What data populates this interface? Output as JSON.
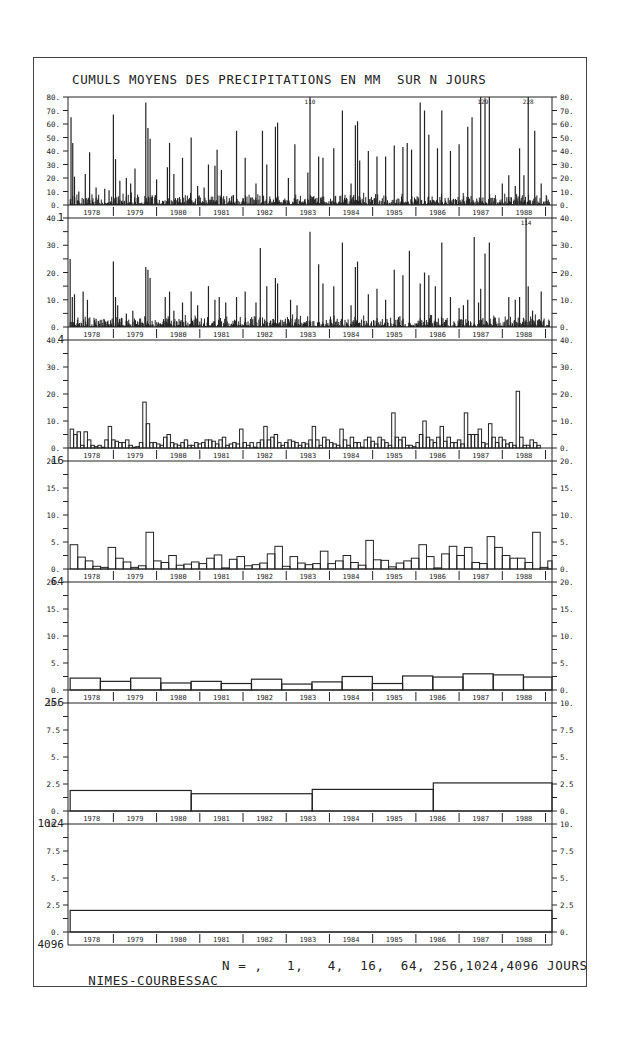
{
  "title": "CUMULS MOYENS DES PRECIPITATIONS EN MM  SUR N JOURS",
  "footer": {
    "station": "NIMES-COURBESSAC",
    "n_label": "N = ,   1,   4,  16,  64, 256,1024,4096 JOURS"
  },
  "chart_data": [
    {
      "type": "bar",
      "title": "N = 1 jour",
      "n_label": "1",
      "ylabel": "mm",
      "ylim": [
        0,
        80
      ],
      "yticks": [
        "0.",
        "10.",
        "20.",
        "30.",
        "40.",
        "50.",
        "60.",
        "70.",
        "80."
      ],
      "annotations": [
        {
          "text": "110",
          "x_year": 1983.55
        },
        {
          "text": "129",
          "x_year": 1987.55
        },
        {
          "text": "228",
          "x_year": 1988.6
        }
      ],
      "years": [
        "1978",
        "1979",
        "1980",
        "1981",
        "1982",
        "1983",
        "1984",
        "1985",
        "1986",
        "1987",
        "1988"
      ],
      "peaks": [
        [
          1978.02,
          65
        ],
        [
          1978.06,
          46
        ],
        [
          1978.1,
          21
        ],
        [
          1978.2,
          10
        ],
        [
          1978.35,
          23
        ],
        [
          1978.45,
          39
        ],
        [
          1978.6,
          13
        ],
        [
          1978.8,
          12
        ],
        [
          1978.9,
          11
        ],
        [
          1979.0,
          67
        ],
        [
          1979.05,
          34
        ],
        [
          1979.15,
          18
        ],
        [
          1979.3,
          20
        ],
        [
          1979.4,
          16
        ],
        [
          1979.5,
          27
        ],
        [
          1979.75,
          76
        ],
        [
          1979.8,
          57
        ],
        [
          1979.85,
          49
        ],
        [
          1980.0,
          19
        ],
        [
          1980.25,
          28
        ],
        [
          1980.3,
          46
        ],
        [
          1980.4,
          23
        ],
        [
          1980.6,
          35
        ],
        [
          1980.8,
          50
        ],
        [
          1980.95,
          14
        ],
        [
          1981.1,
          13
        ],
        [
          1981.2,
          30
        ],
        [
          1981.35,
          29
        ],
        [
          1981.4,
          41
        ],
        [
          1981.5,
          26
        ],
        [
          1981.85,
          55
        ],
        [
          1982.05,
          35
        ],
        [
          1982.3,
          16
        ],
        [
          1982.45,
          55
        ],
        [
          1982.55,
          30
        ],
        [
          1982.75,
          58
        ],
        [
          1982.8,
          61
        ],
        [
          1983.05,
          20
        ],
        [
          1983.2,
          45
        ],
        [
          1983.5,
          24
        ],
        [
          1983.55,
          80
        ],
        [
          1983.75,
          36
        ],
        [
          1983.85,
          35
        ],
        [
          1984.1,
          42
        ],
        [
          1984.3,
          70
        ],
        [
          1984.5,
          16
        ],
        [
          1984.6,
          59
        ],
        [
          1984.65,
          62
        ],
        [
          1984.7,
          33
        ],
        [
          1984.9,
          40
        ],
        [
          1985.1,
          36
        ],
        [
          1985.3,
          36
        ],
        [
          1985.5,
          44
        ],
        [
          1985.7,
          43
        ],
        [
          1985.8,
          46
        ],
        [
          1985.9,
          41
        ],
        [
          1986.1,
          76
        ],
        [
          1986.2,
          70
        ],
        [
          1986.3,
          52
        ],
        [
          1986.5,
          42
        ],
        [
          1986.6,
          70
        ],
        [
          1986.8,
          40
        ],
        [
          1987.0,
          45
        ],
        [
          1987.2,
          58
        ],
        [
          1987.3,
          65
        ],
        [
          1987.5,
          80
        ],
        [
          1987.6,
          79
        ],
        [
          1987.7,
          80
        ],
        [
          1988.0,
          16
        ],
        [
          1988.15,
          22
        ],
        [
          1988.3,
          14
        ],
        [
          1988.4,
          42
        ],
        [
          1988.5,
          22
        ],
        [
          1988.6,
          80
        ],
        [
          1988.75,
          55
        ],
        [
          1988.9,
          16
        ]
      ]
    },
    {
      "type": "bar",
      "title": "N = 4 jours",
      "n_label": "4",
      "ylim": [
        0,
        40
      ],
      "yticks": [
        "0.",
        "10.",
        "20.",
        "30.",
        "40."
      ],
      "annotations": [
        {
          "text": "114",
          "x_year": 1988.55
        }
      ],
      "peaks": [
        [
          1978.0,
          25
        ],
        [
          1978.05,
          11
        ],
        [
          1978.1,
          12
        ],
        [
          1978.3,
          13
        ],
        [
          1978.4,
          10
        ],
        [
          1978.6,
          3
        ],
        [
          1979.0,
          24
        ],
        [
          1979.05,
          11
        ],
        [
          1979.1,
          8
        ],
        [
          1979.3,
          5
        ],
        [
          1979.45,
          6
        ],
        [
          1979.75,
          22
        ],
        [
          1979.8,
          21
        ],
        [
          1979.85,
          18
        ],
        [
          1980.2,
          11
        ],
        [
          1980.3,
          13
        ],
        [
          1980.4,
          6
        ],
        [
          1980.6,
          9
        ],
        [
          1980.8,
          13
        ],
        [
          1980.95,
          8
        ],
        [
          1981.2,
          15
        ],
        [
          1981.35,
          10
        ],
        [
          1981.45,
          11
        ],
        [
          1981.6,
          9
        ],
        [
          1981.85,
          11
        ],
        [
          1982.05,
          13
        ],
        [
          1982.3,
          9
        ],
        [
          1982.4,
          29
        ],
        [
          1982.55,
          15
        ],
        [
          1982.75,
          18
        ],
        [
          1982.8,
          16
        ],
        [
          1983.1,
          10
        ],
        [
          1983.25,
          8
        ],
        [
          1983.55,
          35
        ],
        [
          1983.75,
          23
        ],
        [
          1983.85,
          16
        ],
        [
          1984.1,
          15
        ],
        [
          1984.3,
          31
        ],
        [
          1984.5,
          8
        ],
        [
          1984.6,
          22
        ],
        [
          1984.65,
          24
        ],
        [
          1984.9,
          12
        ],
        [
          1985.1,
          14
        ],
        [
          1985.3,
          10
        ],
        [
          1985.5,
          21
        ],
        [
          1985.7,
          19
        ],
        [
          1985.85,
          28
        ],
        [
          1986.1,
          16
        ],
        [
          1986.2,
          20
        ],
        [
          1986.3,
          19
        ],
        [
          1986.45,
          15
        ],
        [
          1986.6,
          31
        ],
        [
          1986.8,
          11
        ],
        [
          1987.0,
          7
        ],
        [
          1987.1,
          8
        ],
        [
          1987.2,
          10
        ],
        [
          1987.35,
          33
        ],
        [
          1987.45,
          9
        ],
        [
          1987.5,
          14
        ],
        [
          1987.6,
          27
        ],
        [
          1987.7,
          31
        ],
        [
          1988.15,
          11
        ],
        [
          1988.3,
          10
        ],
        [
          1988.4,
          11
        ],
        [
          1988.55,
          40
        ],
        [
          1988.6,
          15
        ],
        [
          1988.7,
          6
        ],
        [
          1988.9,
          13
        ]
      ]
    },
    {
      "type": "bar",
      "title": "N = 16 jours",
      "n_label": "16",
      "ylim": [
        0,
        40
      ],
      "yticks": [
        "0.",
        "10.",
        "20.",
        "30.",
        "40."
      ],
      "values": [
        7,
        5,
        6,
        1,
        6,
        3,
        1,
        0.5,
        1,
        0.3,
        3,
        8,
        3,
        2.5,
        2,
        2,
        3,
        1,
        0.3,
        0.5,
        2,
        17,
        9,
        2,
        2,
        1.5,
        1,
        4,
        5,
        2,
        1.5,
        1,
        2,
        3,
        1,
        1,
        2,
        1.5,
        2,
        3,
        3,
        2.5,
        1.5,
        3,
        4,
        1,
        1.5,
        2,
        1.5,
        7,
        2,
        1,
        2,
        0.3,
        2,
        3,
        8,
        3,
        4,
        5,
        2,
        1,
        2,
        3,
        2.5,
        2,
        1,
        2,
        1.5,
        3,
        8,
        3,
        1,
        4,
        3,
        2,
        1.5,
        1,
        7,
        3,
        1,
        4,
        2,
        2,
        0.3,
        3,
        4,
        2.5,
        1.5,
        4,
        3,
        2,
        1,
        13,
        4,
        3,
        4,
        1,
        1,
        0.5,
        2,
        5,
        10,
        4,
        3,
        2,
        4,
        8,
        2.5,
        4,
        2,
        2,
        3,
        1.5,
        13,
        5,
        5,
        5,
        7,
        2,
        1.5,
        9,
        4,
        2,
        4,
        3,
        1.5,
        2,
        1,
        21,
        4,
        1,
        1,
        3,
        2,
        1
      ],
      "bars_per_year": 12.5
    },
    {
      "type": "bar",
      "title": "N = 64 jours",
      "n_label": "64",
      "ylim": [
        0,
        20
      ],
      "yticks": [
        "0.",
        "5.",
        "10.",
        "15.",
        "20."
      ],
      "values": [
        4.5,
        2.2,
        1.5,
        0.5,
        0.3,
        4,
        2,
        1.3,
        0.3,
        0.6,
        6.8,
        1.5,
        1.2,
        2.5,
        0.7,
        0.9,
        1.3,
        1,
        2,
        2.6,
        0.2,
        1.8,
        2.3,
        0.6,
        0.8,
        1.1,
        2.8,
        4.2,
        0.5,
        2.3,
        1.1,
        0.8,
        1,
        3.3,
        1,
        1.5,
        2.5,
        1.2,
        0.7,
        5.3,
        1.7,
        1.6,
        0.4,
        1.1,
        1.5,
        2,
        4.5,
        2.3,
        0.2,
        2.8,
        4.2,
        2.5,
        4,
        1.2,
        1,
        6,
        4,
        2.5,
        2,
        2,
        1.2,
        6.8,
        0.3,
        1.5
      ],
      "bars_per_year": 5.7
    },
    {
      "type": "bar",
      "title": "N = 256 jours",
      "n_label": "256",
      "ylim": [
        0,
        20
      ],
      "yticks": [
        "0.",
        "5.",
        "10.",
        "15.",
        "20."
      ],
      "values": [
        2.2,
        1.6,
        2.2,
        1.3,
        1.6,
        1.2,
        2,
        1.1,
        1.5,
        2.5,
        1.2,
        2.6,
        2.4,
        3,
        2.8,
        2.4
      ],
      "bars_per_year": 1.43
    },
    {
      "type": "bar",
      "title": "N = 1024 jours",
      "n_label": "1024",
      "ylim": [
        0,
        10
      ],
      "yticks": [
        "0.",
        "2.5",
        "5.",
        "7.5",
        "10."
      ],
      "values": [
        1.9,
        1.6,
        2.0,
        2.6
      ],
      "bars_per_year": 0.357
    },
    {
      "type": "bar",
      "title": "N = 4096 jours",
      "n_label": "4096",
      "ylim": [
        0,
        10
      ],
      "yticks": [
        "0.",
        "2.5",
        "5.",
        "7.5",
        "10."
      ],
      "values": [
        2.0
      ],
      "bars_per_year": 0.0893
    }
  ],
  "x_axis": {
    "years": [
      "1978",
      "1979",
      "1980",
      "1981",
      "1982",
      "1983",
      "1984",
      "1985",
      "1986",
      "1987",
      "1988"
    ],
    "start_year": 1977.95,
    "end_year": 1989.15
  }
}
